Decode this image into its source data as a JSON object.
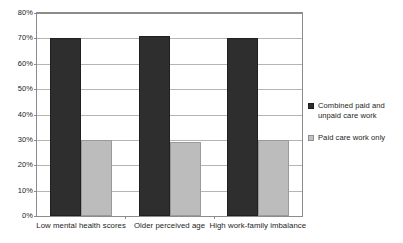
{
  "chart_data": {
    "type": "bar",
    "title": "",
    "subtitle": "",
    "xlabel": "",
    "ylabel": "",
    "ylim": [
      0,
      80
    ],
    "ytick_labels": [
      "0%",
      "10%",
      "20%",
      "30%",
      "40%",
      "50%",
      "60%",
      "70%",
      "80%"
    ],
    "ytick_values": [
      0,
      10,
      20,
      30,
      40,
      50,
      60,
      70,
      80
    ],
    "grid": true,
    "legend_position": "right",
    "categories": [
      "Low mental health scores",
      "Older perceived age",
      "High work-family imbalance"
    ],
    "series": [
      {
        "name": "Combined paid and unpaid care work",
        "color": "#2e2e2e",
        "values": [
          70,
          71,
          70
        ]
      },
      {
        "name": "Paid care work only",
        "color": "#bcbcbc",
        "values": [
          30,
          29,
          30
        ]
      }
    ]
  },
  "legend": {
    "items": [
      {
        "label": "Combined paid and unpaid care work",
        "swatch": "dark-square-icon"
      },
      {
        "label": "Paid care work only",
        "swatch": "light-square-icon"
      }
    ]
  }
}
